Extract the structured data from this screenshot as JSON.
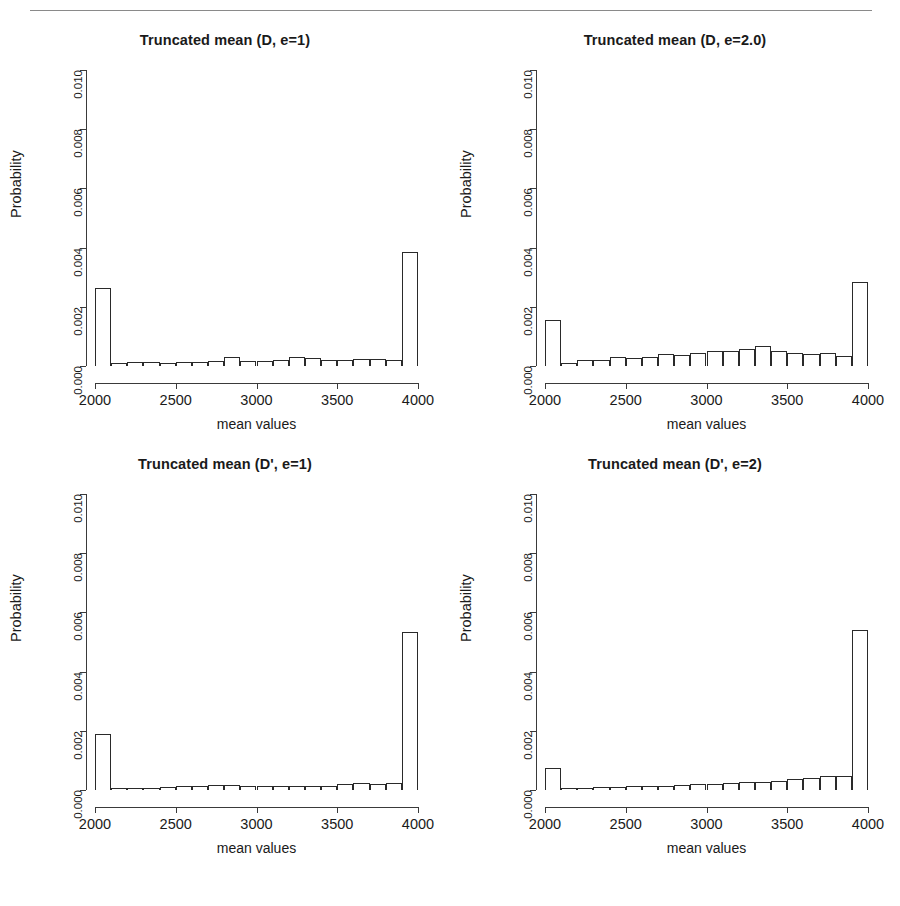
{
  "figure": {
    "has_top_rule": true,
    "axis_title_x": "mean values",
    "axis_title_y": "Probability"
  },
  "chart_data": [
    {
      "type": "bar",
      "title": "Truncated mean (D, e=1)",
      "panel": "top-left",
      "xlabel": "mean values",
      "ylabel": "Probability",
      "xlim": [
        2000,
        4000
      ],
      "ylim": [
        0.0,
        0.01
      ],
      "xticks": [
        2000,
        2500,
        3000,
        3500,
        4000
      ],
      "xtick_labels": [
        "2000",
        "2500",
        "3000",
        "3500",
        "4000"
      ],
      "yticks": [
        0.0,
        0.002,
        0.004,
        0.006,
        0.008,
        0.01
      ],
      "ytick_labels": [
        "0.000",
        "0.002",
        "0.004",
        "0.006",
        "0.008",
        "0.010"
      ],
      "grid": false,
      "legend": null,
      "bin_edges": [
        2000,
        2100,
        2200,
        2300,
        2400,
        2500,
        2600,
        2700,
        2800,
        2900,
        3000,
        3100,
        3200,
        3300,
        3400,
        3500,
        3600,
        3700,
        3800,
        3900,
        4000
      ],
      "bin_centers": [
        2050,
        2150,
        2250,
        2350,
        2450,
        2550,
        2650,
        2750,
        2850,
        2950,
        3050,
        3150,
        3250,
        3350,
        3450,
        3550,
        3650,
        3750,
        3850,
        3950
      ],
      "values": [
        0.00265,
        9e-05,
        0.00012,
        0.00014,
        0.00011,
        0.00012,
        0.00015,
        0.00017,
        0.00029,
        0.00016,
        0.00016,
        0.00022,
        0.0003,
        0.00026,
        0.0002,
        0.0002,
        0.00023,
        0.00024,
        0.00022,
        0.00385
      ]
    },
    {
      "type": "bar",
      "title": "Truncated mean (D, e=2.0)",
      "panel": "top-right",
      "xlabel": "mean values",
      "ylabel": "Probability",
      "xlim": [
        2000,
        4000
      ],
      "ylim": [
        0.0,
        0.01
      ],
      "xticks": [
        2000,
        2500,
        3000,
        3500,
        4000
      ],
      "xtick_labels": [
        "2000",
        "2500",
        "3000",
        "3500",
        "4000"
      ],
      "yticks": [
        0.0,
        0.002,
        0.004,
        0.006,
        0.008,
        0.01
      ],
      "ytick_labels": [
        "0.000",
        "0.002",
        "0.004",
        "0.006",
        "0.008",
        "0.010"
      ],
      "grid": false,
      "legend": null,
      "bin_edges": [
        2000,
        2100,
        2200,
        2300,
        2400,
        2500,
        2600,
        2700,
        2800,
        2900,
        3000,
        3100,
        3200,
        3300,
        3400,
        3500,
        3600,
        3700,
        3800,
        3900,
        4000
      ],
      "bin_centers": [
        2050,
        2150,
        2250,
        2350,
        2450,
        2550,
        2650,
        2750,
        2850,
        2950,
        3050,
        3150,
        3250,
        3350,
        3450,
        3550,
        3650,
        3750,
        3850,
        3950
      ],
      "values": [
        0.00155,
        0.00011,
        0.0002,
        0.00021,
        0.00029,
        0.00026,
        0.00031,
        0.0004,
        0.00038,
        0.00044,
        0.00052,
        0.0005,
        0.00058,
        0.00067,
        0.00052,
        0.00045,
        0.00042,
        0.00043,
        0.00033,
        0.00285
      ]
    },
    {
      "type": "bar",
      "title": "Truncated mean (D', e=1)",
      "panel": "bottom-left",
      "xlabel": "mean values",
      "ylabel": "Probability",
      "xlim": [
        2000,
        4000
      ],
      "ylim": [
        0.0,
        0.01
      ],
      "xticks": [
        2000,
        2500,
        3000,
        3500,
        4000
      ],
      "xtick_labels": [
        "2000",
        "2500",
        "3000",
        "3500",
        "4000"
      ],
      "yticks": [
        0.0,
        0.002,
        0.004,
        0.006,
        0.008,
        0.01
      ],
      "ytick_labels": [
        "0.000",
        "0.002",
        "0.004",
        "0.006",
        "0.008",
        "0.010"
      ],
      "grid": false,
      "legend": null,
      "bin_edges": [
        2000,
        2100,
        2200,
        2300,
        2400,
        2500,
        2600,
        2700,
        2800,
        2900,
        3000,
        3100,
        3200,
        3300,
        3400,
        3500,
        3600,
        3700,
        3800,
        3900,
        4000
      ],
      "bin_centers": [
        2050,
        2150,
        2250,
        2350,
        2450,
        2550,
        2650,
        2750,
        2850,
        2950,
        3050,
        3150,
        3250,
        3350,
        3450,
        3550,
        3650,
        3750,
        3850,
        3950
      ],
      "values": [
        0.0019,
        7e-05,
        8e-05,
        8e-05,
        9e-05,
        0.00013,
        0.00013,
        0.00016,
        0.00016,
        0.00013,
        0.00014,
        0.00014,
        0.00015,
        0.00014,
        0.00013,
        0.00021,
        0.00024,
        0.00021,
        0.00023,
        0.00535
      ]
    },
    {
      "type": "bar",
      "title": "Truncated mean (D', e=2)",
      "panel": "bottom-right",
      "xlabel": "mean values",
      "ylabel": "Probability",
      "xlim": [
        2000,
        4000
      ],
      "ylim": [
        0.0,
        0.01
      ],
      "xticks": [
        2000,
        2500,
        3000,
        3500,
        4000
      ],
      "xtick_labels": [
        "2000",
        "2500",
        "3000",
        "3500",
        "4000"
      ],
      "yticks": [
        0.0,
        0.002,
        0.004,
        0.006,
        0.008,
        0.01
      ],
      "ytick_labels": [
        "0.000",
        "0.002",
        "0.004",
        "0.006",
        "0.008",
        "0.010"
      ],
      "grid": false,
      "legend": null,
      "bin_edges": [
        2000,
        2100,
        2200,
        2300,
        2400,
        2500,
        2600,
        2700,
        2800,
        2900,
        3000,
        3100,
        3200,
        3300,
        3400,
        3500,
        3600,
        3700,
        3800,
        3900,
        4000
      ],
      "bin_centers": [
        2050,
        2150,
        2250,
        2350,
        2450,
        2550,
        2650,
        2750,
        2850,
        2950,
        3050,
        3150,
        3250,
        3350,
        3450,
        3550,
        3650,
        3750,
        3850,
        3950
      ],
      "values": [
        0.00073,
        6e-05,
        8e-05,
        9e-05,
        0.0001,
        0.00013,
        0.00014,
        0.00014,
        0.00016,
        0.00021,
        0.00022,
        0.00023,
        0.00026,
        0.00027,
        0.0003,
        0.00038,
        0.00041,
        0.00046,
        0.00048,
        0.0054
      ]
    }
  ]
}
